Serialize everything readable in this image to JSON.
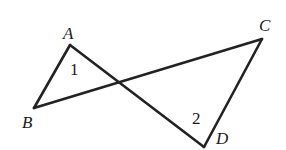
{
  "figure": {
    "points": {
      "A": {
        "label": "A",
        "x": 70,
        "y": 45,
        "lx": 63,
        "ly": 39
      },
      "B": {
        "label": "B",
        "x": 34,
        "y": 108,
        "lx": 22,
        "ly": 128
      },
      "C": {
        "label": "C",
        "x": 262,
        "y": 39,
        "lx": 259,
        "ly": 31
      },
      "D": {
        "label": "D",
        "x": 204,
        "y": 147,
        "lx": 216,
        "ly": 144
      }
    },
    "segments": [
      [
        "A",
        "B"
      ],
      [
        "B",
        "C"
      ],
      [
        "C",
        "D"
      ],
      [
        "D",
        "A"
      ]
    ],
    "angles": [
      {
        "label": "1",
        "x": 70,
        "y": 75
      },
      {
        "label": "2",
        "x": 192,
        "y": 124
      }
    ]
  }
}
